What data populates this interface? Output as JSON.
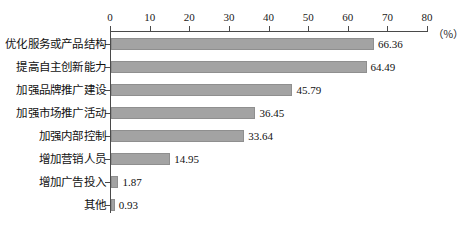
{
  "chart_data": {
    "type": "bar",
    "orientation": "horizontal",
    "title": "",
    "subtitle": "",
    "xlabel": "",
    "ylabel": "",
    "unit_label": "（％）",
    "xlim": [
      0,
      80
    ],
    "xticks": [
      0,
      10,
      20,
      30,
      40,
      50,
      60,
      70,
      80
    ],
    "xtick_labels": [
      "0",
      "10",
      "20",
      "30",
      "40",
      "50",
      "60",
      "70",
      "80"
    ],
    "grid": false,
    "legend": null,
    "categories": [
      "优化服务或产品结构",
      "提高自主创新能力",
      "加强品牌推广建设",
      "加强市场推广活动",
      "加强内部控制",
      "增加营销人员",
      "增加广告投入",
      "其他"
    ],
    "values": [
      66.36,
      64.49,
      45.79,
      36.45,
      33.64,
      14.95,
      1.87,
      0.93
    ],
    "value_labels": [
      "66.36",
      "64.49",
      "45.79",
      "36.45",
      "33.64",
      "14.95",
      "1.87",
      "0.93"
    ],
    "bar_color": "#a3a3a3",
    "bar_border_color": "#8f8f8f",
    "axis_color": "#4a4a4a",
    "text_color": "#111111",
    "background_color": "#ffffff"
  }
}
